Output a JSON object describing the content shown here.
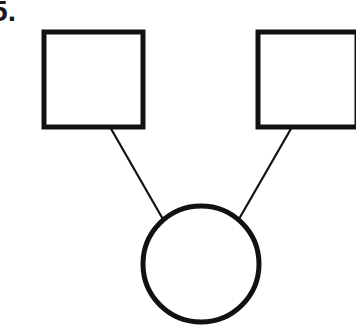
{
  "question": {
    "number_label": "5."
  },
  "diagram": {
    "type": "pedigree-genogram",
    "title": "",
    "nodes": [
      {
        "id": "square-left",
        "shape": "square",
        "symbol_meaning": "male",
        "label": "",
        "x": 44,
        "y": 32,
        "width": 99,
        "height": 95,
        "fill": "#ffffff",
        "stroke": "#111111",
        "stroke_width": 5
      },
      {
        "id": "square-right",
        "shape": "square",
        "symbol_meaning": "male",
        "label": "",
        "x": 258,
        "y": 32,
        "width": 99,
        "height": 95,
        "fill": "#ffffff",
        "stroke": "#111111",
        "stroke_width": 5
      },
      {
        "id": "circle-bottom",
        "shape": "circle",
        "symbol_meaning": "female",
        "label": "",
        "cx": 201,
        "cy": 264,
        "r": 58,
        "fill": "#ffffff",
        "stroke": "#111111",
        "stroke_width": 5
      }
    ],
    "edges": [
      {
        "id": "edge-left",
        "from": "square-left",
        "to": "circle-bottom",
        "x1": 110,
        "y1": 127,
        "x2": 164,
        "y2": 221,
        "stroke": "#111111",
        "stroke_width": 2.2
      },
      {
        "id": "edge-right",
        "from": "square-right",
        "to": "circle-bottom",
        "x1": 292,
        "y1": 127,
        "x2": 239,
        "y2": 219,
        "stroke": "#111111",
        "stroke_width": 2.2
      }
    ],
    "background": "#ffffff"
  }
}
